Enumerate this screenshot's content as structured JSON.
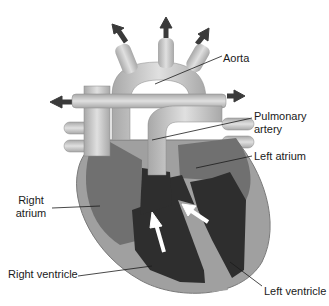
{
  "labels": {
    "aorta": "Aorta",
    "pulmonary_artery_1": "Pulmonary",
    "pulmonary_artery_2": "artery",
    "left_atrium": "Left atrium",
    "right_atrium_1": "Right",
    "right_atrium_2": "atrium",
    "right_ventricle": "Right ventricle",
    "left_ventricle": "Left ventricle"
  },
  "colors": {
    "vessel": "#c8c8c8",
    "wall": "#9a9a9a",
    "chamber_light": "#7a7a7a",
    "chamber_dark": "#2e2e2e",
    "arrow_dark": "#3a3a3a",
    "arrow_white": "#ffffff"
  }
}
